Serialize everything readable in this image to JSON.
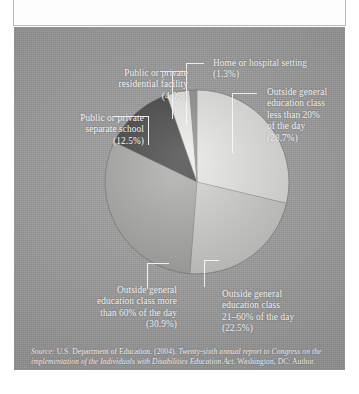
{
  "figure": {
    "title_partial": "",
    "source_prefix": "Source:",
    "source_line1": " U.S. Department of Education. (2004). ",
    "source_italic1": "Twenty-sixth annual report to Congress on the implementation of the Individuals with Disabilities Education Act.",
    "source_tail": " Washington, DC: Author."
  },
  "chart_data": {
    "type": "pie",
    "title": "",
    "xlabel": "",
    "ylabel": "",
    "legend_position": "callout-labels",
    "grid": false,
    "categories": [
      "Outside general education class less than 20% of the day",
      "Outside general education class 21-60% of the day",
      "Outside general education class more than 60% of the day",
      "Public or private separate school",
      "Public or private residential facility",
      "Home or hospital setting"
    ],
    "values": [
      28.7,
      22.5,
      30.9,
      12.5,
      4.0,
      1.3
    ],
    "value_labels": [
      "(28.7%)",
      "(22.5%)",
      "(30.9%)",
      "(12.5%)",
      "(4.0%)",
      "(1.3%)"
    ],
    "colors": [
      "#e9e9e7",
      "#d2d2cf",
      "#a9a9a6",
      "#3c3c3c",
      "#efefec",
      "#8e8e8b"
    ],
    "slices": [
      {
        "name": "less-than-20",
        "label_lines": [
          "Outside general",
          "education class",
          "less than 20%",
          "of the day"
        ],
        "percent_label": "(28.7%)",
        "value": 28.7,
        "color": "#e9e9e7"
      },
      {
        "name": "21-to-60",
        "label_lines": [
          "Outside general",
          "education class",
          "21–60% of the day"
        ],
        "percent_label": "(22.5%)",
        "value": 22.5,
        "color": "#d2d2cf"
      },
      {
        "name": "more-than-60",
        "label_lines": [
          "Outside general",
          "education class more",
          "than 60% of the day"
        ],
        "percent_label": "(30.9%)",
        "value": 30.9,
        "color": "#a9a9a6"
      },
      {
        "name": "separate-school",
        "label_lines": [
          "Public or private",
          "separate school"
        ],
        "percent_label": "(12.5%)",
        "value": 12.5,
        "color": "#3c3c3c"
      },
      {
        "name": "residential-facility",
        "label_lines": [
          "Public or private",
          "residential facility"
        ],
        "percent_label": "(4.0%)",
        "value": 4.0,
        "color": "#efefec"
      },
      {
        "name": "home-or-hospital",
        "label_lines": [
          "Home or hospital setting"
        ],
        "percent_label": "(1.3%)",
        "value": 1.3,
        "color": "#8e8e8b"
      }
    ]
  }
}
